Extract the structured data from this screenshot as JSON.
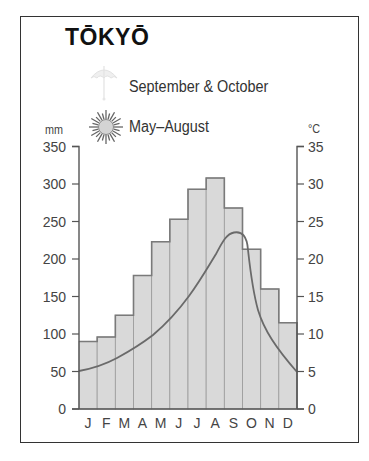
{
  "title": "TŌKYŌ",
  "legend": {
    "items": [
      {
        "icon": "umbrella-icon",
        "label": "September & October"
      },
      {
        "icon": "sun-icon",
        "label": "May–August"
      }
    ]
  },
  "axes": {
    "left_unit": "mm",
    "right_unit": "°C",
    "left_ticks": [
      "350",
      "300",
      "250",
      "200",
      "150",
      "100",
      "50",
      "0"
    ],
    "right_ticks": [
      "35",
      "30",
      "25",
      "20",
      "15",
      "10",
      "5",
      "0"
    ]
  },
  "months": [
    "J",
    "F",
    "M",
    "A",
    "M",
    "J",
    "J",
    "A",
    "S",
    "O",
    "N",
    "D"
  ],
  "colors": {
    "bar_fill": "#d9d9d9",
    "bar_stroke": "#7a7a7a",
    "temp_line": "#6a6a6a",
    "axis": "#555555"
  },
  "chart_data": {
    "type": "bar",
    "title": "TŌKYŌ",
    "categories": [
      "J",
      "F",
      "M",
      "A",
      "M",
      "J",
      "J",
      "A",
      "S",
      "O",
      "N",
      "D"
    ],
    "series": [
      {
        "name": "Precipitation (mm)",
        "type": "bar",
        "axis": "left",
        "values": [
          90,
          96,
          125,
          178,
          223,
          253,
          293,
          308,
          268,
          213,
          160,
          115
        ]
      },
      {
        "name": "Temperature (°C)",
        "type": "line",
        "axis": "right",
        "values": [
          5.5,
          6.2,
          9,
          11.5,
          15.5,
          19.5,
          23,
          23.5,
          22,
          12,
          8,
          5
        ]
      }
    ],
    "xlabel": "",
    "ylabel": "mm",
    "ylabel_right": "°C",
    "ylim": [
      0,
      350
    ],
    "ylim_right": [
      0,
      35
    ],
    "legend": [
      "September & October (rain)",
      "May–August (sun)"
    ],
    "grid": false
  }
}
